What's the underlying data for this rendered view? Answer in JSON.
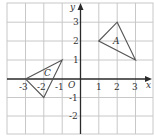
{
  "diagram": {
    "type": "coordinate-grid",
    "x_axis": {
      "label": "x",
      "min": -3,
      "max": 3,
      "ticks": [
        "-3",
        "-2",
        "-1",
        "1",
        "2",
        "3"
      ]
    },
    "y_axis": {
      "label": "y",
      "min": -2,
      "max": 3,
      "ticks": [
        "3",
        "2",
        "1",
        "-1",
        "-2"
      ]
    },
    "origin_label": "O",
    "shapes": [
      {
        "name": "A",
        "vertices": [
          [
            1,
            2
          ],
          [
            2,
            3
          ],
          [
            3,
            1
          ]
        ],
        "label_at": [
          2,
          2
        ]
      },
      {
        "name": "C",
        "vertices": [
          [
            -3,
            0
          ],
          [
            -1,
            1
          ],
          [
            -2,
            -1
          ]
        ],
        "label_at": [
          -1.8,
          0.3
        ]
      }
    ],
    "colors": {
      "grid": "#c8c8c8",
      "axis": "#2a2a2a",
      "shape": "#555555"
    }
  },
  "labels": {
    "x_axis": "x",
    "y_axis": "y",
    "origin": "O",
    "shape_a": "A",
    "shape_c": "C",
    "x_ticks": [
      "-3",
      "-2",
      "-1",
      "1",
      "2",
      "3"
    ],
    "y_ticks": [
      "3",
      "2",
      "1",
      "-1",
      "-2"
    ]
  }
}
